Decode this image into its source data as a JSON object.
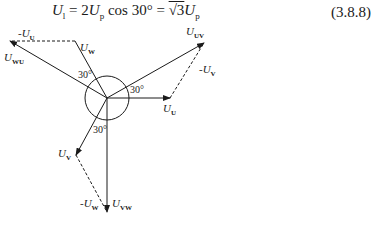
{
  "equation": {
    "lhs": "U",
    "lhs_sub": "l",
    "part1": " = 2",
    "u2": "U",
    "u2_sub": "p",
    "part2": " cos 30° = ",
    "sqrt": "√3",
    "u3": "U",
    "u3_sub": "p",
    "number": "(3.8.8)"
  },
  "phasors": {
    "U_U": {
      "label": "U",
      "sub": "U"
    },
    "U_V": {
      "label": "U",
      "sub": "V"
    },
    "U_W": {
      "label": "U",
      "sub": "W"
    },
    "U_UV": {
      "label": "U",
      "sub": "UV"
    },
    "U_VW": {
      "label": "U",
      "sub": "VW"
    },
    "U_WU": {
      "label": "U",
      "sub": "WU"
    },
    "neg_U_U": {
      "label": "-U",
      "sub": "U"
    },
    "neg_U_V": {
      "label": "-U",
      "sub": "V"
    },
    "neg_U_W": {
      "label": "-U",
      "sub": "W"
    }
  },
  "angles": {
    "a1": "30°",
    "a2": "30°",
    "a3": "30°"
  }
}
